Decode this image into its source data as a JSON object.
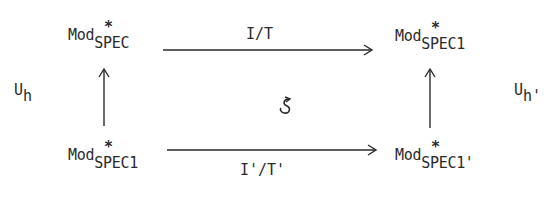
{
  "diagram": {
    "type": "commutative-square",
    "nodes": {
      "top_left": {
        "base": "Mod",
        "sup": "*",
        "sub": "SPEC"
      },
      "top_right": {
        "base": "Mod",
        "sup": "*",
        "sub": "SPEC1"
      },
      "bottom_left": {
        "base": "Mod",
        "sup": "*",
        "sub": "SPEC1"
      },
      "bottom_right": {
        "base": "Mod",
        "sup": "*",
        "sub": "SPEC1'"
      }
    },
    "edges": {
      "top": {
        "label": "I/T",
        "from": "top_left",
        "to": "top_right"
      },
      "bottom": {
        "label": "I'/T'",
        "from": "bottom_left",
        "to": "bottom_right"
      },
      "left": {
        "label_base": "U",
        "label_sub": "h",
        "from": "bottom_left",
        "to": "top_left"
      },
      "right": {
        "label_base": "U",
        "label_sub": "h'",
        "from": "bottom_right",
        "to": "top_right"
      }
    },
    "center_symbol": "↺",
    "colors": {
      "ink": "#2a2a2a",
      "background": "#ffffff"
    }
  }
}
